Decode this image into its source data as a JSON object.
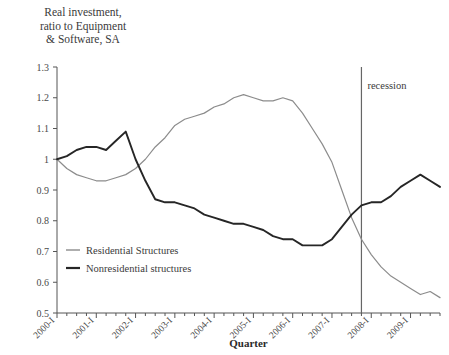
{
  "chart_data": {
    "type": "line",
    "title": "Real investment,\nratio to Equipment\n& Software, SA",
    "xlabel": "Quarter",
    "ylabel": "",
    "ylim": [
      0.5,
      1.3
    ],
    "ytick_step": 0.1,
    "yticks": [
      "1.3",
      "1.2",
      "1.1",
      "1",
      "0.9",
      "0.8",
      "0.7",
      "0.6",
      "0.5"
    ],
    "grid": false,
    "legend_position": "inside-lower-left",
    "x_tick_frequency": "quarterly",
    "categories": [
      "2000-I",
      "2000-II",
      "2000-III",
      "2000-IV",
      "2001-I",
      "2001-II",
      "2001-III",
      "2001-IV",
      "2002-I",
      "2002-II",
      "2002-III",
      "2002-IV",
      "2003-I",
      "2003-II",
      "2003-III",
      "2003-IV",
      "2004-I",
      "2004-II",
      "2004-III",
      "2004-IV",
      "2005-I",
      "2005-II",
      "2005-III",
      "2005-IV",
      "2006-I",
      "2006-II",
      "2006-III",
      "2006-IV",
      "2007-I",
      "2007-II",
      "2007-III",
      "2007-IV",
      "2008-I",
      "2008-II",
      "2008-III",
      "2008-IV",
      "2009-I",
      "2009-II",
      "2009-III",
      "2009-IV"
    ],
    "xtick_labels": [
      "2000-I",
      "2001-I",
      "2002-I",
      "2003-I",
      "2004-I",
      "2005-I",
      "2006-I",
      "2007-I",
      "2008-I",
      "2009-I"
    ],
    "series": [
      {
        "name": "Residential Structures",
        "color": "#8c8c8c",
        "values": [
          1.0,
          0.97,
          0.95,
          0.94,
          0.93,
          0.93,
          0.94,
          0.95,
          0.97,
          1.0,
          1.04,
          1.07,
          1.11,
          1.13,
          1.14,
          1.15,
          1.17,
          1.18,
          1.2,
          1.21,
          1.2,
          1.19,
          1.19,
          1.2,
          1.19,
          1.15,
          1.1,
          1.05,
          0.99,
          0.9,
          0.81,
          0.74,
          0.69,
          0.65,
          0.62,
          0.6,
          0.58,
          0.56,
          0.57,
          0.55
        ]
      },
      {
        "name": "Nonresidential structures",
        "color": "#262626",
        "values": [
          1.0,
          1.01,
          1.03,
          1.04,
          1.04,
          1.03,
          1.06,
          1.09,
          1.0,
          0.93,
          0.87,
          0.86,
          0.86,
          0.85,
          0.84,
          0.82,
          0.81,
          0.8,
          0.79,
          0.79,
          0.78,
          0.77,
          0.75,
          0.74,
          0.74,
          0.72,
          0.72,
          0.72,
          0.74,
          0.78,
          0.82,
          0.85,
          0.86,
          0.86,
          0.88,
          0.91,
          0.93,
          0.95,
          0.93,
          0.91
        ]
      }
    ],
    "annotations": [
      {
        "label": "recession",
        "type": "vline",
        "at_category": "2007-IV"
      }
    ]
  }
}
